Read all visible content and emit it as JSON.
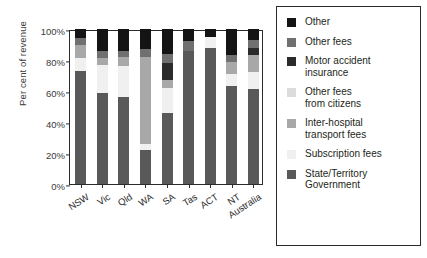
{
  "chart_data": {
    "type": "bar",
    "subtype": "stacked-100-percent",
    "title": "",
    "xlabel": "",
    "ylabel": "Per cent of revenue",
    "ylim": [
      0,
      100
    ],
    "yticks": [
      0,
      20,
      40,
      60,
      80,
      100
    ],
    "ytick_labels": [
      "0%",
      "20%",
      "40%",
      "60%",
      "80%",
      "100%"
    ],
    "grid": false,
    "legend_position": "right",
    "categories": [
      "NSW",
      "Vic",
      "Qld",
      "WA",
      "SA",
      "Tas",
      "ACT",
      "NT",
      "Australia"
    ],
    "series": [
      {
        "name": "State/Territory Government",
        "color": "#595959",
        "values": [
          73,
          59,
          56,
          22,
          46,
          86,
          88,
          63,
          61
        ]
      },
      {
        "name": "Subscription fees",
        "color": "#f0f0f0",
        "values": [
          8,
          18,
          20,
          4,
          16,
          0,
          7,
          8,
          11
        ]
      },
      {
        "name": "Inter-hospital transport fees",
        "color": "#a8a8a8",
        "values": [
          9,
          4,
          6,
          56,
          5,
          0,
          0,
          8,
          11
        ]
      },
      {
        "name": "Other fees from citizens",
        "color": "#dcdcdc",
        "values": [
          0,
          0,
          0,
          0,
          0,
          0,
          0,
          0,
          0
        ]
      },
      {
        "name": "Motor accident insurance",
        "color": "#2b2b2b",
        "values": [
          0,
          0,
          0,
          0,
          11,
          0,
          0,
          0,
          5
        ]
      },
      {
        "name": "Other fees",
        "color": "#707070",
        "values": [
          4,
          5,
          4,
          5,
          6,
          6,
          0,
          4,
          5
        ]
      },
      {
        "name": "Other",
        "color": "#141414",
        "values": [
          6,
          14,
          14,
          13,
          16,
          8,
          5,
          17,
          7
        ]
      }
    ]
  },
  "legend": {
    "items": [
      {
        "label": "Other",
        "color": "#141414"
      },
      {
        "label": "Other fees",
        "color": "#707070"
      },
      {
        "label": "Motor accident\ninsurance",
        "color": "#2b2b2b"
      },
      {
        "label": "Other fees\nfrom citizens",
        "color": "#dcdcdc"
      },
      {
        "label": "Inter-hospital\ntransport fees",
        "color": "#a8a8a8"
      },
      {
        "label": "Subscription fees",
        "color": "#f0f0f0"
      },
      {
        "label": "State/Territory\nGovernment",
        "color": "#595959"
      }
    ]
  }
}
